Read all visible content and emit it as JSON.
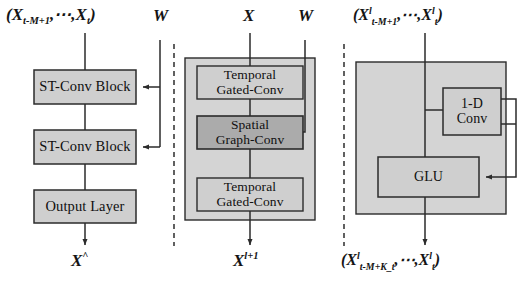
{
  "figure": {
    "name": "STGCN architecture diagram",
    "background": "#ffffff",
    "colors": {
      "panel_fill": "#d4d4d4",
      "box_fill": "#cfcfcf",
      "box_fill_dark": "#ababab",
      "stroke": "#2b2b2b",
      "text": "#101010"
    }
  },
  "panels": {
    "left": {
      "input_label": {
        "open": "(",
        "x1": "X",
        "sub1": "t-M+1",
        "dots": ",⋯,",
        "x2": "X",
        "sub2": "t",
        "close": ")"
      },
      "weight_label": "W",
      "blocks": [
        {
          "label": "ST-Conv Block"
        },
        {
          "label": "ST-Conv Block"
        },
        {
          "label": "Output Layer"
        }
      ],
      "output_label": {
        "x": "X",
        "sup": "^"
      }
    },
    "middle": {
      "input_label": {
        "x": "X"
      },
      "weight_label": "W",
      "blocks": [
        {
          "label": "Temporal\nGated-Conv",
          "line1": "Temporal",
          "line2": "Gated-Conv",
          "shade": "light"
        },
        {
          "label": "Spatial\nGraph-Conv",
          "line1": "Spatial",
          "line2": "Graph-Conv",
          "shade": "dark"
        },
        {
          "label": "Temporal\nGated-Conv",
          "line1": "Temporal",
          "line2": "Gated-Conv",
          "shade": "light"
        }
      ],
      "output_label": {
        "x": "X",
        "sup": "l+1"
      }
    },
    "right": {
      "input_label": {
        "open": "(",
        "x1": "X",
        "sup1": "l",
        "sub1": "t-M+1",
        "dots": ",⋯,",
        "x2": "X",
        "sup2": "l",
        "sub2": "t",
        "close": ")"
      },
      "blocks": [
        {
          "line1": "1-D",
          "line2": "Conv"
        },
        {
          "line1": "GLU",
          "line2": ""
        }
      ],
      "output_label": {
        "open": "(",
        "x1": "X",
        "sup1": "l",
        "sub1": "t-M+K_t",
        "dots": ",⋯,",
        "x2": "X",
        "sup2": "l",
        "sub2": "t",
        "close": ")"
      }
    }
  }
}
